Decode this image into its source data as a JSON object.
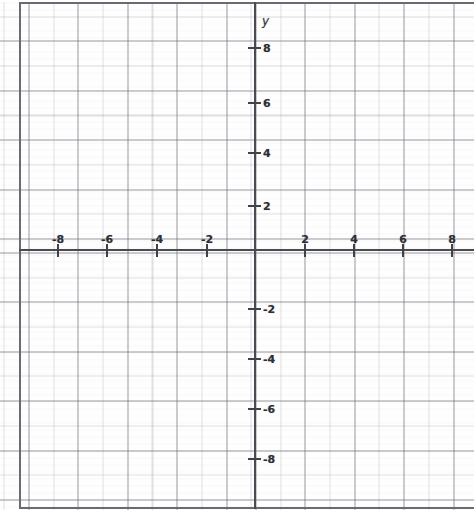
{
  "figure": {
    "kind": "cartesian-coordinate-grid",
    "background_color": "#ffffff",
    "axis_color": "#4a4a52",
    "grid_minor_color": "#8a8a93",
    "grid_major_color": "#5f5f6c",
    "border_color": "#6a6a72",
    "label_color": "#2e2e35"
  },
  "axes": {
    "y_axis_name": "y",
    "x_axis_name": "",
    "origin_px": {
      "x": 255,
      "y": 250
    },
    "unit_px": 24.7
  },
  "chart_data": {
    "type": "scatter",
    "title": "",
    "subtitle": "",
    "xlabel": "",
    "ylabel": "y",
    "grid": true,
    "minor_grid": true,
    "minor_grid_step": 1,
    "major_grid_step": 2,
    "legend": "none",
    "xlim": [
      -9.5,
      8.9
    ],
    "ylim": [
      -10.1,
      9.6
    ],
    "xticks": [
      -8,
      -6,
      -4,
      -2,
      2,
      4,
      6,
      8
    ],
    "yticks": [
      8,
      6,
      4,
      2,
      -2,
      -4,
      -6,
      -8
    ],
    "xtick_labels": [
      "-8",
      "-6",
      "-4",
      "-2",
      "2",
      "4",
      "6",
      "8"
    ],
    "ytick_labels": [
      "8",
      "6",
      "4",
      "2",
      "-2",
      "-4",
      "-6",
      "-8"
    ],
    "series": [],
    "values": [],
    "annotations": []
  },
  "x_ticks": [
    {
      "value": -8,
      "label": "-8",
      "px": 57
    },
    {
      "value": -6,
      "label": "-6",
      "px": 106
    },
    {
      "value": -4,
      "label": "-4",
      "px": 156
    },
    {
      "value": -2,
      "label": "-2",
      "px": 206
    },
    {
      "value": 2,
      "label": "2",
      "px": 304
    },
    {
      "value": 4,
      "label": "4",
      "px": 353
    },
    {
      "value": 6,
      "label": "6",
      "px": 402
    },
    {
      "value": 8,
      "label": "8",
      "px": 451
    }
  ],
  "y_ticks": [
    {
      "value": 8,
      "label": "8",
      "px": 47
    },
    {
      "value": 6,
      "label": "6",
      "px": 102
    },
    {
      "value": 4,
      "label": "4",
      "px": 152
    },
    {
      "value": 2,
      "label": "2",
      "px": 205
    },
    {
      "value": -2,
      "label": "-2",
      "px": 308
    },
    {
      "value": -4,
      "label": "-4",
      "px": 358
    },
    {
      "value": -6,
      "label": "-6",
      "px": 408
    },
    {
      "value": -8,
      "label": "-8",
      "px": 458
    }
  ]
}
